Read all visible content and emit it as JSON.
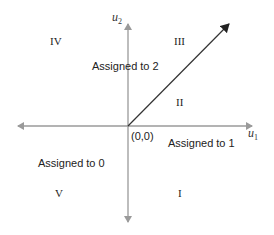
{
  "diagram": {
    "axes": {
      "x_label": "u",
      "x_sub": "1",
      "y_label": "u",
      "y_sub": "2",
      "origin_label": "(0,0)",
      "axis_color": "#9a9a9a"
    },
    "arrow": {
      "color": "#333333",
      "from": [
        0,
        0
      ],
      "direction": "diagonal upper-right"
    },
    "regions": [
      {
        "id": "I",
        "label": "I"
      },
      {
        "id": "II",
        "label": "II"
      },
      {
        "id": "III",
        "label": "III"
      },
      {
        "id": "IV",
        "label": "IV"
      },
      {
        "id": "V",
        "label": "V"
      }
    ],
    "assignments": {
      "to0": "Assigned to 0",
      "to1": "Assigned to 1",
      "to2": "Assigned to 2"
    }
  }
}
